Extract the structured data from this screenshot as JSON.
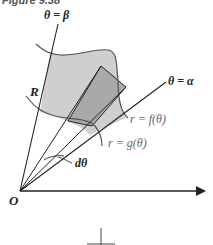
{
  "figure": {
    "title": "Figure 9.38"
  },
  "labels": {
    "beta_ray": "θ = β",
    "alpha_ray": "θ = α",
    "region": "R",
    "outer_curve": "r = f(θ)",
    "inner_curve": "r = g(θ)",
    "dtheta": "dθ",
    "origin": "O"
  },
  "colors": {
    "region_fill": "#cfcfcf",
    "wedge_fill": "#a9a9a9",
    "stroke": "#222222",
    "curve_stroke": "#555555"
  }
}
